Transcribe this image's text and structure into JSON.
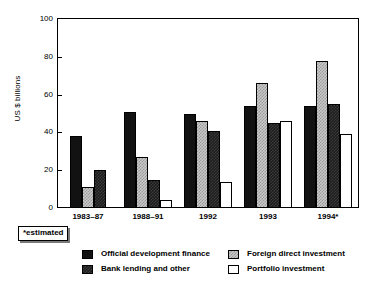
{
  "chart_data": {
    "type": "bar",
    "title": "",
    "xlabel": "",
    "ylabel": "US $ billions",
    "ylim": [
      0,
      100
    ],
    "yticks": [
      0,
      20,
      40,
      60,
      80,
      100
    ],
    "grid": false,
    "legend_position": "bottom",
    "categories": [
      "1983–87",
      "1988–91",
      "1992",
      "1993",
      "1994*"
    ],
    "series": [
      {
        "name": "Official development finance",
        "key": "odf",
        "color": "#121212",
        "pattern": "solid-black",
        "values": [
          38,
          51,
          50,
          54,
          54
        ]
      },
      {
        "name": "Foreign direct investment",
        "key": "fdi",
        "color": "#c9c9c9",
        "pattern": "light-gray-checker",
        "values": [
          11,
          27,
          46,
          66,
          78
        ]
      },
      {
        "name": "Bank lending and other",
        "key": "bank",
        "color": "#1c1c1c",
        "pattern": "dark-checker",
        "values": [
          20,
          15,
          41,
          45,
          55
        ]
      },
      {
        "name": "Portfolio investment",
        "key": "port",
        "color": "#ffffff",
        "pattern": "white-dotted",
        "values": [
          null,
          4,
          14,
          46,
          39
        ]
      }
    ],
    "annotations": [
      "*estimated"
    ]
  },
  "axes": {
    "y_title": "US $ billions",
    "y_tick_labels": [
      "0",
      "20",
      "40",
      "60",
      "80",
      "100"
    ],
    "x_tick_labels": [
      "1983–87",
      "1988–91",
      "1992",
      "1993",
      "1994*"
    ]
  },
  "note": {
    "text": "*estimated"
  },
  "legend": {
    "items": [
      {
        "label": "Official development finance"
      },
      {
        "label": "Bank lending and other"
      },
      {
        "label": "Foreign direct investment"
      },
      {
        "label": "Portfolio investment"
      }
    ]
  }
}
